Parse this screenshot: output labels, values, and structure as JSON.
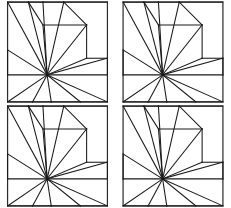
{
  "figure": {
    "panel_count": 4,
    "layout": "2x2-grid",
    "background_color": "#ffffff",
    "line_color": "#1a1a1a",
    "border_color": "#2b2b2b",
    "panels": [
      {
        "id": "panel-top-left",
        "label": "a",
        "position": "top-left"
      },
      {
        "id": "panel-top-right",
        "label": "b",
        "position": "top-right"
      },
      {
        "id": "panel-bottom-left",
        "label": "c",
        "position": "bottom-left"
      },
      {
        "id": "panel-bottom-right",
        "label": "d",
        "position": "bottom-right"
      }
    ]
  },
  "chart_data": {
    "type": "diagram",
    "panel_count": 4,
    "geometry": {
      "viewbox": [
        0,
        0,
        100,
        100
      ],
      "square": {
        "x": 2,
        "y": 2,
        "width": 96,
        "height": 96
      },
      "hub": {
        "x": 40,
        "y": 72
      },
      "boundary_vertices": [
        {
          "name": "corner-tl",
          "x": 2,
          "y": 2
        },
        {
          "name": "top-a",
          "x": 22,
          "y": 2
        },
        {
          "name": "top-b",
          "x": 36,
          "y": 2
        },
        {
          "name": "top-c",
          "x": 56,
          "y": 2
        },
        {
          "name": "corner-tr",
          "x": 98,
          "y": 2
        },
        {
          "name": "right-a",
          "x": 98,
          "y": 56
        },
        {
          "name": "right-b",
          "x": 98,
          "y": 72
        },
        {
          "name": "corner-br",
          "x": 98,
          "y": 98
        },
        {
          "name": "bottom-a",
          "x": 72,
          "y": 98
        },
        {
          "name": "bottom-b",
          "x": 44,
          "y": 98
        },
        {
          "name": "bottom-c",
          "x": 26,
          "y": 98
        },
        {
          "name": "corner-bl",
          "x": 2,
          "y": 98
        },
        {
          "name": "left-a",
          "x": 2,
          "y": 72
        },
        {
          "name": "left-b",
          "x": 2,
          "y": 48
        }
      ],
      "interior_vertices": [
        {
          "name": "inner-step-1",
          "x": 36,
          "y": 24
        },
        {
          "name": "inner-step-2",
          "x": 78,
          "y": 24
        },
        {
          "name": "inner-step-3",
          "x": 78,
          "y": 56
        }
      ],
      "fan_spokes": [
        [
          40,
          72,
          2,
          48
        ],
        [
          40,
          72,
          2,
          72
        ],
        [
          40,
          72,
          2,
          98
        ],
        [
          40,
          72,
          26,
          98
        ],
        [
          40,
          72,
          44,
          98
        ],
        [
          40,
          72,
          72,
          98
        ],
        [
          40,
          72,
          98,
          98
        ],
        [
          40,
          72,
          98,
          72
        ],
        [
          40,
          72,
          98,
          56
        ],
        [
          40,
          72,
          78,
          56
        ],
        [
          40,
          72,
          78,
          24
        ],
        [
          40,
          72,
          56,
          2
        ],
        [
          40,
          72,
          36,
          24
        ],
        [
          40,
          72,
          36,
          2
        ],
        [
          40,
          72,
          22,
          2
        ],
        [
          40,
          72,
          2,
          2
        ]
      ],
      "chord_segments": [
        [
          2,
          2,
          22,
          2
        ],
        [
          22,
          2,
          36,
          2
        ],
        [
          36,
          2,
          56,
          2
        ],
        [
          56,
          2,
          98,
          2
        ],
        [
          36,
          24,
          78,
          24
        ],
        [
          78,
          24,
          78,
          56
        ],
        [
          56,
          2,
          78,
          24
        ],
        [
          36,
          24,
          22,
          2
        ],
        [
          78,
          56,
          98,
          56
        ],
        [
          98,
          56,
          98,
          72
        ],
        [
          2,
          72,
          2,
          48
        ],
        [
          2,
          98,
          26,
          98
        ],
        [
          26,
          98,
          44,
          98
        ],
        [
          44,
          98,
          72,
          98
        ],
        [
          72,
          98,
          98,
          98
        ]
      ]
    }
  }
}
